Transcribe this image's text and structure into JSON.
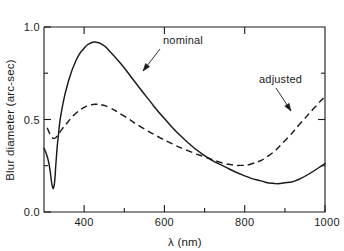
{
  "chart_data": {
    "type": "line",
    "title": "",
    "xlabel": "λ (nm)",
    "ylabel": "Blur diameter  (arc-sec)",
    "xlim": [
      300,
      1000
    ],
    "ylim": [
      0.0,
      1.0
    ],
    "grid": false,
    "legend_position": "inline-annotations",
    "x_ticks_major": [
      400,
      600,
      800,
      1000
    ],
    "x_ticks_minor": [
      500,
      700,
      900
    ],
    "x_tick_labels": [
      "400",
      "600",
      "800",
      "1000"
    ],
    "y_ticks_major": [
      0.0,
      0.5,
      1.0
    ],
    "y_tick_labels": [
      "0.0",
      "0.5",
      "1.0"
    ],
    "series": [
      {
        "name": "nominal",
        "style": "solid",
        "color": "#1a1a1a",
        "x": [
          300,
          308,
          314,
          318,
          321,
          324,
          327,
          330,
          336,
          345,
          360,
          380,
          400,
          415,
          430,
          445,
          460,
          490,
          520,
          560,
          600,
          650,
          700,
          750,
          800,
          840,
          870,
          900,
          940,
          1000
        ],
        "y": [
          0.345,
          0.3,
          0.24,
          0.175,
          0.138,
          0.132,
          0.175,
          0.27,
          0.42,
          0.56,
          0.7,
          0.82,
          0.885,
          0.912,
          0.918,
          0.905,
          0.878,
          0.805,
          0.722,
          0.61,
          0.505,
          0.392,
          0.305,
          0.245,
          0.195,
          0.168,
          0.155,
          0.158,
          0.182,
          0.262
        ]
      },
      {
        "name": "adjusted",
        "style": "dashed",
        "color": "#1a1a1a",
        "x": [
          308,
          314,
          320,
          325,
          332,
          345,
          360,
          380,
          400,
          415,
          430,
          445,
          465,
          500,
          540,
          580,
          620,
          660,
          700,
          740,
          760,
          790,
          820,
          860,
          900,
          940,
          970,
          1000
        ],
        "y": [
          0.455,
          0.425,
          0.405,
          0.398,
          0.408,
          0.448,
          0.488,
          0.535,
          0.565,
          0.578,
          0.582,
          0.578,
          0.562,
          0.518,
          0.462,
          0.412,
          0.368,
          0.33,
          0.298,
          0.268,
          0.258,
          0.252,
          0.262,
          0.305,
          0.385,
          0.482,
          0.555,
          0.625
        ]
      }
    ],
    "annotations": [
      {
        "id": "nominal-label",
        "text": "nominal",
        "label_x": 163,
        "label_y": 44,
        "arrow_from_x": 160,
        "arrow_from_y": 49,
        "arrow_to_x": 143,
        "arrow_to_y": 71
      },
      {
        "id": "adjusted-label",
        "text": "adjusted",
        "label_x": 259,
        "label_y": 83,
        "arrow_from_x": 276,
        "arrow_from_y": 88,
        "arrow_to_x": 291,
        "arrow_to_y": 111
      }
    ]
  }
}
